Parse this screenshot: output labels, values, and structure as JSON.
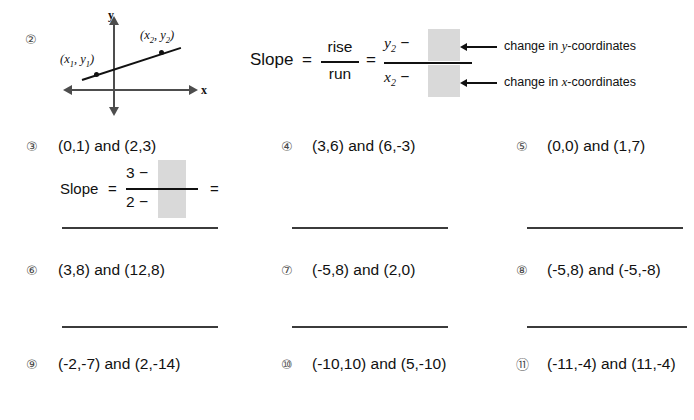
{
  "worksheet": {
    "example": {
      "number": "②",
      "graph": {
        "x_axis_label": "x",
        "y_axis_label": "y",
        "point1_label": "(x1, y1)",
        "point2_label": "(x2, y2)"
      },
      "formula": {
        "slope_word": "Slope",
        "equals1": "=",
        "rise": "rise",
        "run": "run",
        "equals2": "=",
        "numerator_lead": "y2 −",
        "denominator_lead": "x2 −",
        "numerator_blank": "",
        "denominator_blank": ""
      },
      "annotations": {
        "top": "change in y-coordinates",
        "bottom": "change in x-coordinates"
      }
    },
    "worked_example": {
      "slope_word": "Slope",
      "equals1": "=",
      "numerator_lead": "3 −",
      "denominator_lead": "2 −",
      "equals2": "=",
      "numerator_blank": "",
      "denominator_blank": ""
    },
    "problems": [
      {
        "number": "③",
        "text": "(0,1) and (2,3)"
      },
      {
        "number": "④",
        "text": "(3,6) and (6,-3)"
      },
      {
        "number": "⑤",
        "text": "(0,0) and (1,7)"
      },
      {
        "number": "⑥",
        "text": "(3,8) and (12,8)"
      },
      {
        "number": "⑦",
        "text": "(-5,8) and (2,0)"
      },
      {
        "number": "⑧",
        "text": "(-5,8) and (-5,-8)"
      },
      {
        "number": "⑨",
        "text": "(-2,-7) and (2,-14)"
      },
      {
        "number": "⑩",
        "text": "(-10,10) and (5,-10)"
      },
      {
        "number": "⑪",
        "text": "(-11,-4) and (11,-4)"
      }
    ],
    "colors": {
      "ink": "#111111",
      "rule": "#3b3b3b",
      "blank_fill": "#d9d9d9",
      "axis": "#4d4d4d",
      "number_gray": "#4a4a4a",
      "page": "#ffffff"
    }
  }
}
